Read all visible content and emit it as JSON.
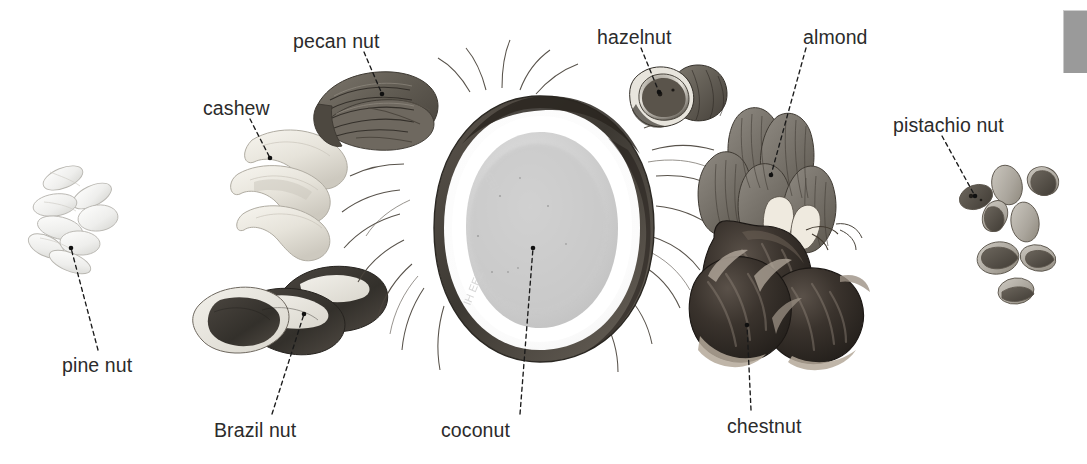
{
  "plate": {
    "title": "Nuts",
    "background_color": "#ffffff",
    "width": 1087,
    "height": 464,
    "label_color": "#2b2b2b",
    "leader_line_color": "#1a1a1a"
  },
  "corner_bar": {
    "name": "gray-corner-bar",
    "color": "#9a9a9a",
    "x": 1063,
    "y": 10,
    "width": 24,
    "height": 62
  },
  "labels": [
    {
      "id": "pecan-nut",
      "text": "pecan nut",
      "x": 293,
      "y": 32,
      "anchor_x": 382,
      "anchor_y": 94,
      "line_start_x": 364,
      "line_start_y": 52
    },
    {
      "id": "hazelnut",
      "text": "hazelnut",
      "x": 597,
      "y": 28,
      "anchor_x": 659,
      "anchor_y": 92,
      "line_start_x": 641,
      "line_start_y": 48
    },
    {
      "id": "almond",
      "text": "almond",
      "x": 803,
      "y": 28,
      "anchor_x": 771,
      "anchor_y": 175,
      "line_start_x": 806,
      "line_start_y": 48
    },
    {
      "id": "cashew",
      "text": "cashew",
      "x": 203,
      "y": 99,
      "anchor_x": 270,
      "anchor_y": 158,
      "line_start_x": 250,
      "line_start_y": 119
    },
    {
      "id": "pistachio-nut",
      "text": "pistachio nut",
      "x": 893,
      "y": 116,
      "anchor_x": 975,
      "anchor_y": 196,
      "line_start_x": 942,
      "line_start_y": 136
    },
    {
      "id": "pine-nut",
      "text": "pine nut",
      "x": 62,
      "y": 356,
      "anchor_x": 71,
      "anchor_y": 248,
      "line_start_x": 98,
      "line_start_y": 350
    },
    {
      "id": "brazil-nut",
      "text": "Brazil nut",
      "x": 214,
      "y": 421,
      "anchor_x": 304,
      "anchor_y": 314,
      "line_start_x": 272,
      "line_start_y": 414
    },
    {
      "id": "coconut",
      "text": "coconut",
      "x": 441,
      "y": 421,
      "anchor_x": 533,
      "anchor_y": 248,
      "line_start_x": 520,
      "line_start_y": 414
    },
    {
      "id": "chestnut",
      "text": "chestnut",
      "x": 727,
      "y": 417,
      "anchor_x": 747,
      "anchor_y": 325,
      "line_start_x": 751,
      "line_start_y": 410
    }
  ],
  "specimens": [
    {
      "id": "pine-nut-cluster",
      "label": "pine nut",
      "description": "cluster of pale cream elongated teardrop seeds",
      "count": 8,
      "tone": "very light"
    },
    {
      "id": "cashew-group",
      "label": "cashew",
      "description": "three pale curved kidney-shaped kernels",
      "count": 3,
      "tone": "light"
    },
    {
      "id": "pecan-nut-single",
      "label": "pecan nut",
      "description": "oval ridged grooved kernel, medium grey-brown",
      "count": 1,
      "tone": "medium dark"
    },
    {
      "id": "brazil-nut-group",
      "label": "Brazil nut",
      "description": "three elongated three-sided nuts, dark shell with pale patches",
      "count": 3,
      "tone": "dark with light patches"
    },
    {
      "id": "coconut-half",
      "label": "coconut",
      "description": "halved coconut, dark fibrous husk ring with pale white flesh and stray fibres",
      "count": 1,
      "tone": "dark rim, pale centre"
    },
    {
      "id": "hazelnut-pair",
      "label": "hazelnut",
      "description": "two round nuts, one showing cut face",
      "count": 2,
      "tone": "medium dark"
    },
    {
      "id": "almond-group",
      "label": "almond",
      "description": "five teardrop kernels with striated texture, two split showing pale interior",
      "count": 5,
      "tone": "medium"
    },
    {
      "id": "chestnut-group",
      "label": "chestnut",
      "description": "three glossy round-domed nuts with pale hilum patches",
      "count": 3,
      "tone": "very dark"
    },
    {
      "id": "pistachio-cluster",
      "label": "pistachio nut",
      "description": "seven small oval nuts, some split open",
      "count": 7,
      "tone": "light to medium"
    }
  ]
}
